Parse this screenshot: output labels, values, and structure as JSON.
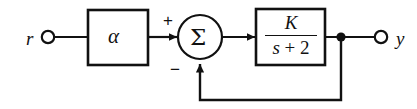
{
  "diagram": {
    "type": "control-system-block-diagram",
    "stroke_color": "#111111",
    "background_color": "#ffffff",
    "nodes": {
      "input_terminal": {
        "label": "r",
        "shape": "open-circle",
        "x": 48,
        "y": 37
      },
      "gain_block": {
        "label": "α",
        "shape": "rectangle",
        "x": 88,
        "y": 10,
        "width": 60,
        "height": 55
      },
      "summing_junction": {
        "label": "Σ",
        "shape": "circle",
        "cx": 200,
        "cy": 37,
        "r": 22,
        "signs": {
          "input_left": "+",
          "input_bottom": "−"
        }
      },
      "plant_block": {
        "shape": "rectangle",
        "x": 256,
        "y": 9,
        "width": 69,
        "height": 56,
        "transfer_function": {
          "numerator": "K",
          "denominator_variable": "s",
          "denominator_operator": "+",
          "denominator_constant": "2",
          "display": "K / (s + 2)"
        }
      },
      "takeoff_point": {
        "shape": "filled-dot",
        "x": 341,
        "y": 37
      },
      "output_terminal": {
        "label": "y",
        "shape": "open-circle",
        "x": 381,
        "y": 37
      }
    },
    "edges": [
      {
        "name": "r-to-alpha",
        "from": "input_terminal",
        "to": "gain_block",
        "arrow": false
      },
      {
        "name": "alpha-to-sum",
        "from": "gain_block",
        "to": "summing_junction",
        "arrow": true,
        "sign": "+"
      },
      {
        "name": "sum-to-plant",
        "from": "summing_junction",
        "to": "plant_block",
        "arrow": true
      },
      {
        "name": "plant-to-takeoff",
        "from": "plant_block",
        "to": "takeoff_point",
        "arrow": false
      },
      {
        "name": "takeoff-to-output",
        "from": "takeoff_point",
        "to": "output_terminal",
        "arrow": false
      },
      {
        "name": "feedback-path",
        "from": "takeoff_point",
        "to": "summing_junction",
        "arrow": true,
        "sign": "−",
        "routing": "down-left-up"
      }
    ]
  },
  "labels": {
    "input": "r",
    "output": "y",
    "gain": "α",
    "sum": "Σ",
    "plus": "+",
    "minus": "−",
    "numerator": "K",
    "den_var": "s",
    "den_op": "+",
    "den_const": "2"
  }
}
